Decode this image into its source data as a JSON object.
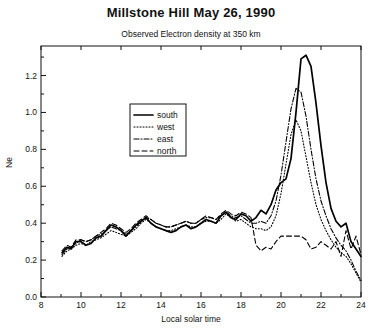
{
  "chart_data": {
    "type": "line",
    "title": "Millstone Hill   May 26, 1990",
    "subtitle": "Observed Electron density at 350 km",
    "xlabel": "Local solar time",
    "ylabel": "Ne",
    "xlim": [
      8,
      24
    ],
    "ylim": [
      0.0,
      1.36
    ],
    "xticks": [
      8,
      10,
      12,
      14,
      16,
      18,
      20,
      22,
      24
    ],
    "yticks": [
      0.0,
      0.2,
      0.4,
      0.6,
      0.8,
      1.0,
      1.2
    ],
    "ytick_labels": [
      "0.0",
      "0.2",
      "0.4",
      "0.6",
      "0.8",
      "1.0",
      "1.2"
    ],
    "xtick_labels": [
      "8",
      "10",
      "12",
      "14",
      "16",
      "18",
      "20",
      "22",
      "24"
    ],
    "grid": false,
    "legend_position": "upper-left-inside",
    "legend": [
      {
        "name": "south",
        "style": "solid",
        "color": "#000000"
      },
      {
        "name": "west",
        "style": "dotted",
        "color": "#000000"
      },
      {
        "name": "east",
        "style": "dashdot",
        "color": "#000000"
      },
      {
        "name": "north",
        "style": "dashed",
        "color": "#000000"
      }
    ],
    "series": [
      {
        "name": "south",
        "style": "solid",
        "x": [
          9.05,
          9.3,
          9.5,
          9.75,
          10.0,
          10.25,
          10.5,
          10.75,
          11.0,
          11.25,
          11.5,
          11.75,
          12.0,
          12.25,
          12.5,
          12.75,
          13.0,
          13.25,
          13.5,
          13.75,
          14.0,
          14.25,
          14.5,
          14.75,
          15.0,
          15.25,
          15.5,
          15.75,
          16.0,
          16.25,
          16.5,
          16.75,
          17.0,
          17.25,
          17.5,
          17.75,
          18.0,
          18.25,
          18.5,
          18.75,
          19.0,
          19.25,
          19.5,
          19.75,
          20.0,
          20.25,
          20.5,
          20.75,
          21.0,
          21.25,
          21.5,
          21.75,
          22.0,
          22.25,
          22.5,
          22.75,
          23.0,
          23.25,
          23.5,
          23.75,
          24.0
        ],
        "y": [
          0.24,
          0.27,
          0.26,
          0.3,
          0.3,
          0.28,
          0.29,
          0.32,
          0.33,
          0.36,
          0.39,
          0.38,
          0.36,
          0.33,
          0.36,
          0.39,
          0.41,
          0.43,
          0.4,
          0.38,
          0.37,
          0.36,
          0.35,
          0.36,
          0.38,
          0.39,
          0.37,
          0.38,
          0.4,
          0.42,
          0.41,
          0.4,
          0.44,
          0.46,
          0.43,
          0.42,
          0.45,
          0.44,
          0.41,
          0.43,
          0.47,
          0.45,
          0.5,
          0.58,
          0.62,
          0.64,
          0.75,
          1.0,
          1.29,
          1.31,
          1.25,
          1.05,
          0.82,
          0.62,
          0.48,
          0.41,
          0.38,
          0.4,
          0.3,
          0.26,
          0.22
        ]
      },
      {
        "name": "west",
        "style": "dotted",
        "x": [
          9.05,
          9.3,
          9.5,
          9.75,
          10.0,
          10.25,
          10.5,
          10.75,
          11.0,
          11.25,
          11.5,
          11.75,
          12.0,
          12.25,
          12.5,
          12.75,
          13.0,
          13.25,
          13.5,
          13.75,
          14.0,
          14.25,
          14.5,
          14.75,
          15.0,
          15.25,
          15.5,
          15.75,
          16.0,
          16.25,
          16.5,
          16.75,
          17.0,
          17.25,
          17.5,
          17.75,
          18.0,
          18.25,
          18.5,
          18.75,
          19.0,
          19.25,
          19.5,
          19.75,
          20.0,
          20.25,
          20.5,
          20.75,
          21.0,
          21.25,
          21.5,
          21.75,
          22.0,
          22.25,
          22.5,
          22.75,
          23.0,
          23.25,
          23.5,
          23.75,
          24.0
        ],
        "y": [
          0.22,
          0.25,
          0.26,
          0.28,
          0.29,
          0.28,
          0.3,
          0.31,
          0.32,
          0.34,
          0.36,
          0.35,
          0.34,
          0.33,
          0.35,
          0.37,
          0.4,
          0.42,
          0.4,
          0.38,
          0.37,
          0.36,
          0.36,
          0.37,
          0.38,
          0.39,
          0.38,
          0.38,
          0.4,
          0.41,
          0.41,
          0.4,
          0.42,
          0.45,
          0.43,
          0.41,
          0.42,
          0.4,
          0.38,
          0.37,
          0.37,
          0.36,
          0.38,
          0.44,
          0.56,
          0.72,
          0.88,
          0.96,
          0.9,
          0.76,
          0.62,
          0.5,
          0.42,
          0.36,
          0.31,
          0.27,
          0.24,
          0.22,
          0.18,
          0.13,
          0.08
        ]
      },
      {
        "name": "east",
        "style": "dashdot",
        "x": [
          9.05,
          9.3,
          9.5,
          9.75,
          10.0,
          10.25,
          10.5,
          10.75,
          11.0,
          11.25,
          11.5,
          11.75,
          12.0,
          12.25,
          12.5,
          12.75,
          13.0,
          13.25,
          13.5,
          13.75,
          14.0,
          14.25,
          14.5,
          14.75,
          15.0,
          15.25,
          15.5,
          15.75,
          16.0,
          16.25,
          16.5,
          16.75,
          17.0,
          17.25,
          17.5,
          17.75,
          18.0,
          18.25,
          18.5,
          18.75,
          19.0,
          19.25,
          19.5,
          19.75,
          20.0,
          20.25,
          20.5,
          20.75,
          21.0,
          21.25,
          21.5,
          21.75,
          22.0,
          22.25,
          22.5,
          22.75,
          23.0,
          23.25,
          23.5,
          23.75,
          24.0
        ],
        "y": [
          0.23,
          0.26,
          0.27,
          0.29,
          0.31,
          0.3,
          0.31,
          0.33,
          0.34,
          0.36,
          0.38,
          0.37,
          0.36,
          0.34,
          0.36,
          0.38,
          0.41,
          0.43,
          0.42,
          0.4,
          0.39,
          0.38,
          0.38,
          0.39,
          0.4,
          0.41,
          0.4,
          0.4,
          0.42,
          0.43,
          0.43,
          0.42,
          0.44,
          0.46,
          0.44,
          0.43,
          0.44,
          0.42,
          0.4,
          0.4,
          0.41,
          0.4,
          0.44,
          0.52,
          0.66,
          0.84,
          1.02,
          1.13,
          1.11,
          0.98,
          0.8,
          0.64,
          0.52,
          0.44,
          0.37,
          0.32,
          0.28,
          0.25,
          0.2,
          0.14,
          0.09
        ]
      },
      {
        "name": "north",
        "style": "dashed",
        "x": [
          9.05,
          9.3,
          9.5,
          9.75,
          10.0,
          10.25,
          10.5,
          10.75,
          11.0,
          11.25,
          11.5,
          11.75,
          12.0,
          12.25,
          12.5,
          12.75,
          13.0,
          13.25,
          13.5,
          13.75,
          14.0,
          14.25,
          14.5,
          14.75,
          15.0,
          15.25,
          15.5,
          15.75,
          16.0,
          16.25,
          16.5,
          16.75,
          17.0,
          17.25,
          17.5,
          17.75,
          18.0,
          18.25,
          18.5,
          18.75,
          19.0,
          19.25,
          19.5,
          19.75,
          20.0,
          20.25,
          20.5,
          20.75,
          21.0,
          21.25,
          21.5,
          21.75,
          22.0,
          22.25,
          22.5,
          22.75,
          23.0,
          23.25,
          23.5,
          23.75,
          24.0
        ],
        "y": [
          0.25,
          0.28,
          0.27,
          0.31,
          0.31,
          0.3,
          0.31,
          0.33,
          0.35,
          0.37,
          0.4,
          0.39,
          0.37,
          0.35,
          0.37,
          0.4,
          0.42,
          0.44,
          0.42,
          0.4,
          0.39,
          0.38,
          0.38,
          0.39,
          0.4,
          0.41,
          0.4,
          0.4,
          0.42,
          0.44,
          0.43,
          0.42,
          0.45,
          0.47,
          0.45,
          0.44,
          0.46,
          0.45,
          0.43,
          0.28,
          0.25,
          0.27,
          0.26,
          0.3,
          0.33,
          0.33,
          0.33,
          0.33,
          0.33,
          0.31,
          0.26,
          0.27,
          0.3,
          0.28,
          0.26,
          0.3,
          0.22,
          0.36,
          0.26,
          0.33,
          0.23
        ]
      }
    ]
  }
}
